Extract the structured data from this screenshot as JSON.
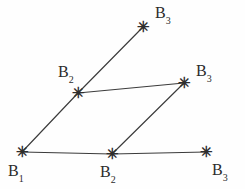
{
  "figure": {
    "background_color": "#fefefe",
    "line_color": "#3b3b3b",
    "text_color": "#2b2b2b",
    "marker_glyph": "✳",
    "marker_name": "asterisk-marker"
  },
  "vertices": [
    {
      "id": "b1-origin",
      "label_base": "B",
      "label_sub": "1",
      "x": 22,
      "y": 152,
      "label_x": 8,
      "label_y": 163
    },
    {
      "id": "b2-lower",
      "label_base": "B",
      "label_sub": "2",
      "x": 112,
      "y": 154,
      "label_x": 100,
      "label_y": 164
    },
    {
      "id": "b3-lower-right",
      "label_base": "B",
      "label_sub": "3",
      "x": 206,
      "y": 152,
      "label_x": 212,
      "label_y": 162
    },
    {
      "id": "b2-upper",
      "label_base": "B",
      "label_sub": "2",
      "x": 78,
      "y": 93,
      "label_x": 58,
      "label_y": 64
    },
    {
      "id": "b3-middle-right",
      "label_base": "B",
      "label_sub": "3",
      "x": 184,
      "y": 83,
      "label_x": 196,
      "label_y": 63
    },
    {
      "id": "b3-top",
      "label_base": "B",
      "label_sub": "3",
      "x": 143,
      "y": 27,
      "label_x": 155,
      "label_y": 5
    }
  ],
  "edges": [
    {
      "id": "edge-b1-to-b2-lower",
      "from": "b1-origin",
      "to": "b2-lower"
    },
    {
      "id": "edge-b2-lower-to-b3-lower",
      "from": "b2-lower",
      "to": "b3-lower-right"
    },
    {
      "id": "edge-b1-to-b2-upper",
      "from": "b1-origin",
      "to": "b2-upper"
    },
    {
      "id": "edge-b2-upper-to-b3-middle",
      "from": "b2-upper",
      "to": "b3-middle-right"
    },
    {
      "id": "edge-b2-lower-to-b3-middle",
      "from": "b2-lower",
      "to": "b3-middle-right"
    },
    {
      "id": "edge-b2-upper-to-b3-top",
      "from": "b2-upper",
      "to": "b3-top"
    }
  ]
}
